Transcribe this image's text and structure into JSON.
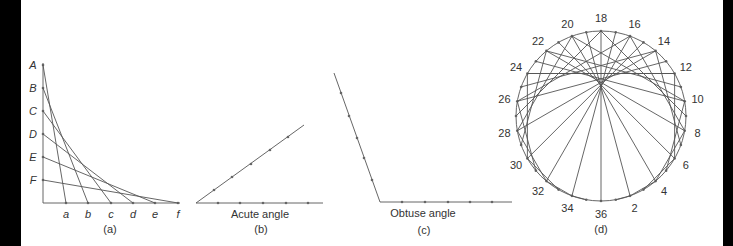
{
  "figure_a": {
    "caption": "(a)",
    "vertical_labels": [
      "A",
      "B",
      "C",
      "D",
      "E",
      "F"
    ],
    "horizontal_labels": [
      "a",
      "b",
      "c",
      "d",
      "e",
      "f"
    ],
    "origin": [
      43,
      203
    ],
    "vertical_ys": [
      65,
      88,
      111,
      134,
      157,
      180
    ],
    "horizontal_xs": [
      66,
      88,
      111,
      133,
      155,
      178
    ],
    "connections": [
      [
        "A",
        "a"
      ],
      [
        "B",
        "b"
      ],
      [
        "C",
        "c"
      ],
      [
        "D",
        "d"
      ],
      [
        "E",
        "e"
      ],
      [
        "F",
        "f"
      ]
    ]
  },
  "figure_b": {
    "title": "Acute angle",
    "caption": "(b)",
    "vertex": [
      196,
      203
    ],
    "arm1_end": [
      304,
      125
    ],
    "arm2_end": [
      323,
      203
    ],
    "arm1_dots": [
      [
        214,
        190
      ],
      [
        232,
        177
      ],
      [
        251,
        164
      ],
      [
        270,
        150
      ],
      [
        288,
        137
      ]
    ],
    "arm2_dots": [
      218,
      240,
      263,
      286,
      308
    ]
  },
  "figure_c": {
    "title": "Obtuse angle",
    "caption": "(c)",
    "vertex": [
      380,
      202
    ],
    "arm1_end": [
      334,
      73
    ],
    "arm2_end": [
      512,
      202
    ],
    "arm1_dots": [
      [
        341,
        93
      ],
      [
        349,
        116
      ],
      [
        357,
        138
      ],
      [
        364,
        158
      ],
      [
        372,
        180
      ]
    ],
    "arm2_dots": [
      402,
      425,
      448,
      470,
      492
    ]
  },
  "figure_d": {
    "caption": "(d)",
    "center": [
      601,
      116
    ],
    "radius": 85,
    "point_count": 36,
    "rule": "n -> 2n mod 36",
    "labels": [
      2,
      4,
      6,
      8,
      10,
      12,
      14,
      16,
      18,
      20,
      22,
      24,
      26,
      28,
      30,
      32,
      34,
      36
    ]
  }
}
